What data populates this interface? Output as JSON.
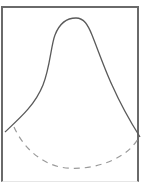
{
  "diagram": {
    "colors": {
      "frame": "#6a6a6a",
      "solid_curve": "#5a5a5a",
      "dashed_curve": "#9a9a9a",
      "background": "#ffffff"
    },
    "curves": [
      {
        "name": "solid-bell-curve",
        "style": "solid"
      },
      {
        "name": "dashed-u-curve",
        "style": "dashed"
      }
    ]
  }
}
